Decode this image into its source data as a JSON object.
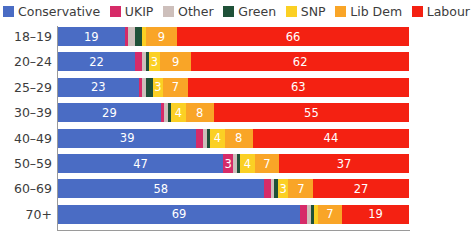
{
  "legend": {
    "items": [
      {
        "label": "Conservative",
        "color": "#4a6cc4",
        "key": "conservative"
      },
      {
        "label": "UKIP",
        "color": "#d62b68",
        "key": "ukip"
      },
      {
        "label": "Other",
        "color": "#cdbfbb",
        "key": "other"
      },
      {
        "label": "Green",
        "color": "#1f5138",
        "key": "green"
      },
      {
        "label": "SNP",
        "color": "#fbd024",
        "key": "snp"
      },
      {
        "label": "Lib Dem",
        "color": "#f9a527",
        "key": "libdem"
      },
      {
        "label": "Labour",
        "color": "#f42112",
        "key": "labour"
      }
    ]
  },
  "chart_data": {
    "type": "bar",
    "orientation": "horizontal",
    "stacked": true,
    "normalized_to": 100,
    "title": "",
    "subtitle": "",
    "xlabel": "",
    "ylabel": "",
    "xlim": [
      0,
      100
    ],
    "grid": false,
    "legend_position": "top",
    "categories": [
      "18–19",
      "20–24",
      "25–29",
      "30–39",
      "40–49",
      "50–59",
      "60–69",
      "70+"
    ],
    "series": [
      {
        "name": "Conservative",
        "color": "#4a6cc4",
        "values": [
          19,
          22,
          23,
          29,
          39,
          47,
          58,
          69
        ]
      },
      {
        "name": "UKIP",
        "color": "#d62b68",
        "values": [
          1,
          2,
          1,
          1,
          2,
          3,
          2,
          2
        ]
      },
      {
        "name": "Other",
        "color": "#cdbfbb",
        "values": [
          2,
          1,
          1,
          1,
          1,
          1,
          1,
          1
        ]
      },
      {
        "name": "Green",
        "color": "#1f5138",
        "values": [
          2,
          1,
          2,
          1,
          1,
          1,
          1,
          1
        ]
      },
      {
        "name": "SNP",
        "color": "#fbd024",
        "values": [
          1,
          3,
          3,
          4,
          4,
          4,
          3,
          1
        ]
      },
      {
        "name": "Lib Dem",
        "color": "#f9a527",
        "values": [
          9,
          9,
          7,
          8,
          8,
          7,
          7,
          7
        ]
      },
      {
        "name": "Labour",
        "color": "#f42112",
        "values": [
          66,
          62,
          63,
          55,
          44,
          37,
          27,
          19
        ]
      }
    ],
    "visible_labels": {
      "18–19": {
        "Conservative": "19",
        "SNP": "",
        "Lib Dem": "9",
        "Labour": "66"
      },
      "20–24": {
        "Conservative": "22",
        "SNP": "3",
        "Lib Dem": "9",
        "Labour": "62"
      },
      "25–29": {
        "Conservative": "23",
        "SNP": "3",
        "Lib Dem": "7",
        "Labour": "63"
      },
      "30–39": {
        "Conservative": "29",
        "SNP": "4",
        "Lib Dem": "8",
        "Labour": "55"
      },
      "40–49": {
        "Conservative": "39",
        "SNP": "4",
        "Lib Dem": "8",
        "Labour": "44"
      },
      "50–59": {
        "Conservative": "47",
        "UKIP": "3",
        "SNP": "4",
        "Lib Dem": "7",
        "Labour": "37"
      },
      "60–69": {
        "Conservative": "58",
        "SNP": "3",
        "Lib Dem": "7",
        "Labour": "27"
      },
      "70+": {
        "Conservative": "69",
        "Lib Dem": "7",
        "Labour": "19"
      }
    }
  }
}
